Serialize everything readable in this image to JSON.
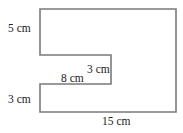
{
  "diagram": {
    "type": "composite-shape",
    "stroke_color": "#7a7a7a",
    "labels": {
      "top_left_side": "5 cm",
      "notch_right_side": "3 cm",
      "notch_top_length": "8 cm",
      "bottom_left_side": "3 cm",
      "bottom_length": "15 cm"
    }
  }
}
